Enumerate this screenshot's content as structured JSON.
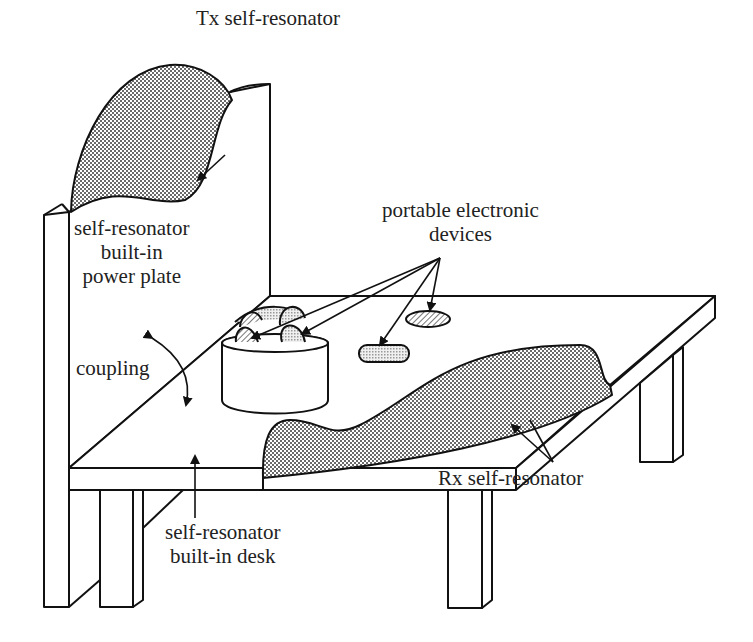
{
  "diagram": {
    "labels": {
      "tx": "Tx self-resonator",
      "power_plate": [
        "self-resonator",
        "built-in",
        "power plate"
      ],
      "portable": [
        "portable electronic",
        "devices"
      ],
      "coupling": "coupling",
      "rx": "Rx self-resonator",
      "desk": [
        "self-resonator",
        "built-in desk"
      ]
    },
    "colors": {
      "line": "#111111",
      "resonator_fill": "#b8b8b8",
      "device_fill": "#cfcfcf",
      "background": "#ffffff"
    },
    "components": [
      "back power plate",
      "desk top",
      "legs",
      "Tx self-resonator",
      "Rx self-resonator",
      "cup with devices",
      "portable devices"
    ]
  }
}
